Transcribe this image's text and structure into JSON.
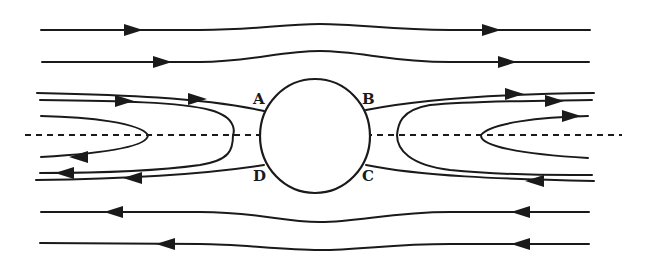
{
  "diagram": {
    "colors": {
      "line": "#1a1a1a",
      "background": "#ffffff"
    },
    "points": [
      {
        "id": "A",
        "label": "A"
      },
      {
        "id": "B",
        "label": "B"
      },
      {
        "id": "C",
        "label": "C"
      },
      {
        "id": "D",
        "label": "D"
      }
    ],
    "symmetry_axis": "dashed horizontal line",
    "streamlines": [
      {
        "name": "outer-top-1",
        "direction": "right"
      },
      {
        "name": "outer-top-2",
        "direction": "right"
      },
      {
        "name": "separating-top",
        "direction": "right",
        "passes": [
          "A",
          "B"
        ]
      },
      {
        "name": "left-recirc-outer",
        "direction": "loop"
      },
      {
        "name": "left-recirc-inner",
        "direction": "loop"
      },
      {
        "name": "right-recirc-outer",
        "direction": "loop"
      },
      {
        "name": "right-recirc-inner",
        "direction": "loop"
      },
      {
        "name": "separating-bottom",
        "direction": "left",
        "passes": [
          "C",
          "D"
        ]
      },
      {
        "name": "outer-bottom-1",
        "direction": "left"
      },
      {
        "name": "outer-bottom-2",
        "direction": "left"
      }
    ]
  }
}
